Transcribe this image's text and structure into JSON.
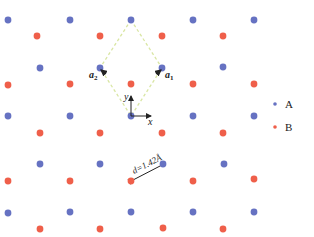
{
  "diagram": {
    "type": "honeycomb-lattice",
    "top_text_fragment": "",
    "colors": {
      "A": "#6672c2",
      "B": "#ef5f4a",
      "unit_cell": "#d9e6a3",
      "axis": "#222222"
    },
    "sites_A": [
      [
        8,
        20
      ],
      [
        70,
        20
      ],
      [
        131,
        20
      ],
      [
        193,
        20
      ],
      [
        254,
        20
      ],
      [
        40,
        68
      ],
      [
        100,
        68
      ],
      [
        162,
        68
      ],
      [
        223,
        67
      ],
      [
        8,
        116
      ],
      [
        70,
        116
      ],
      [
        131,
        116
      ],
      [
        193,
        116
      ],
      [
        254,
        116
      ],
      [
        40,
        164
      ],
      [
        100,
        164
      ],
      [
        163,
        164
      ],
      [
        224,
        164
      ],
      [
        8,
        213
      ],
      [
        70,
        212
      ],
      [
        131,
        212
      ],
      [
        193,
        212
      ],
      [
        254,
        212
      ]
    ],
    "sites_B": [
      [
        37,
        36
      ],
      [
        100,
        36
      ],
      [
        162,
        36
      ],
      [
        223,
        36
      ],
      [
        8,
        85
      ],
      [
        70,
        84
      ],
      [
        131,
        84
      ],
      [
        193,
        84
      ],
      [
        254,
        84
      ],
      [
        40,
        133
      ],
      [
        100,
        133
      ],
      [
        162,
        133
      ],
      [
        223,
        133
      ],
      [
        8,
        181
      ],
      [
        70,
        181
      ],
      [
        131,
        181
      ],
      [
        193,
        181
      ],
      [
        254,
        179
      ],
      [
        40,
        229
      ],
      [
        100,
        229
      ],
      [
        163,
        228
      ],
      [
        223,
        229
      ]
    ],
    "unit_cell": [
      [
        131,
        20
      ],
      [
        162,
        68
      ],
      [
        131,
        116
      ],
      [
        100,
        68
      ]
    ],
    "labels": {
      "a1": "a",
      "a1_sub": "1",
      "a2": "a",
      "a2_sub": "2",
      "x_axis": "x",
      "y_axis": "y",
      "bond": "d=1.42Å"
    },
    "legend": {
      "items": [
        {
          "label": "A",
          "color_key": "A"
        },
        {
          "label": "B",
          "color_key": "B"
        }
      ]
    }
  }
}
